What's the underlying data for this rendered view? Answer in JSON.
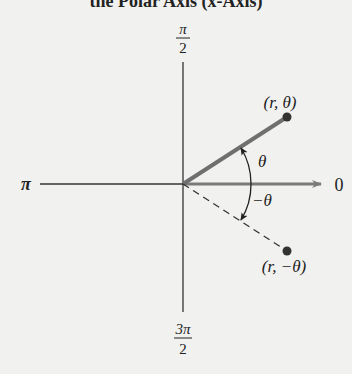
{
  "figure": {
    "title": "the Polar Axis (x-Axis)",
    "axis_labels": {
      "top_num": "π",
      "top_den": "2",
      "left": "π",
      "right": "0",
      "bottom_num": "3π",
      "bottom_den": "2"
    },
    "points": [
      {
        "label": "(r, θ)",
        "style": "solid ray"
      },
      {
        "label": "(r, −θ)",
        "style": "dashed ray"
      }
    ],
    "angles": [
      {
        "label": "θ",
        "direction": "counterclockwise"
      },
      {
        "label": "−θ",
        "direction": "clockwise"
      }
    ],
    "colors": {
      "background": "#f1f1ef",
      "ray": "#6f6f6f",
      "axis": "#333333",
      "arrow": "#7a7a7a"
    }
  }
}
